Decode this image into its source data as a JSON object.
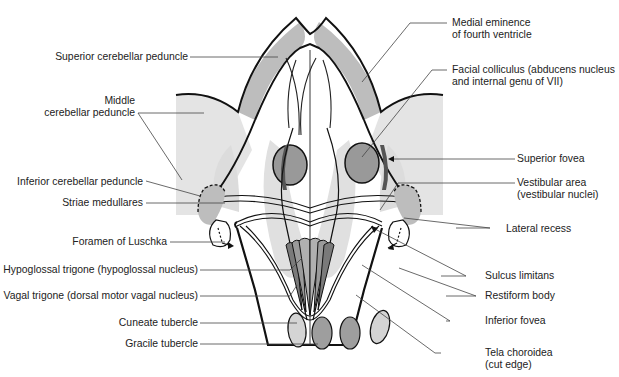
{
  "figure": {
    "colors": {
      "outline": "#111111",
      "dark_gray": "#8a8a8a",
      "mid_gray": "#a8a8a8",
      "light_gray": "#c8c8c8",
      "pale_gray": "#e2e2e2",
      "leader": "#444444",
      "background": "#ffffff"
    }
  },
  "labels_left": {
    "superior_cerebellar_peduncle": "Superior cerebellar peduncle",
    "middle_cerebellar_peduncle_1": "Middle",
    "middle_cerebellar_peduncle_2": "cerebellar peduncle",
    "inferior_cerebellar_peduncle": "Inferior cerebellar peduncle",
    "striae_medullares": "Striae medullares",
    "foramen_of_luschka": "Foramen of Luschka",
    "hypoglossal_trigone": "Hypoglossal trigone (hypoglossal nucleus)",
    "vagal_trigone": "Vagal trigone (dorsal motor vagal nucleus)",
    "cuneate_tubercle": "Cuneate tubercle",
    "gracile_tubercle": "Gracile tubercle"
  },
  "labels_right": {
    "medial_eminence_1": "Medial eminence",
    "medial_eminence_2": "of fourth ventricle",
    "facial_colliculus_1": "Facial colliculus (abducens nucleus",
    "facial_colliculus_2": "and internal genu of VII)",
    "superior_fovea": "Superior fovea",
    "vestibular_area_1": "Vestibular area",
    "vestibular_area_2": "(vestibular nuclei)",
    "lateral_recess": "Lateral recess",
    "sulcus_limitans": "Sulcus limitans",
    "restiform_body": "Restiform body",
    "inferior_fovea": "Inferior fovea",
    "tela_choroidea_1": "Tela choroidea",
    "tela_choroidea_2": "(cut edge)"
  }
}
